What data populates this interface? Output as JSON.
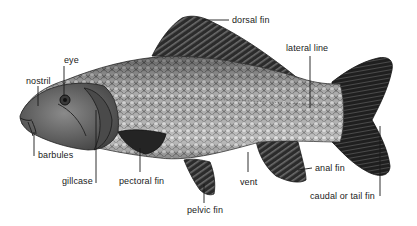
{
  "diagram": {
    "labels": [
      {
        "id": "dorsal-fin",
        "text": "dorsal fin",
        "x": 232,
        "y": 16
      },
      {
        "id": "eye",
        "text": "eye",
        "x": 64,
        "y": 56
      },
      {
        "id": "lateral-line",
        "text": "lateral line",
        "x": 286,
        "y": 43
      },
      {
        "id": "nostril",
        "text": "nostril",
        "x": 26,
        "y": 76
      },
      {
        "id": "barbules",
        "text": "barbules",
        "x": 38,
        "y": 150
      },
      {
        "id": "gillcase",
        "text": "gillcase",
        "x": 62,
        "y": 175
      },
      {
        "id": "pectoral-fin",
        "text": "pectoral fin",
        "x": 119,
        "y": 175
      },
      {
        "id": "anal-fin",
        "text": "anal fin",
        "x": 315,
        "y": 163
      },
      {
        "id": "vent",
        "text": "vent",
        "x": 240,
        "y": 177
      },
      {
        "id": "caudal-fin",
        "text": "caudal or tail fin",
        "x": 310,
        "y": 191
      },
      {
        "id": "pelvic-fin",
        "text": "pelvic fin",
        "x": 187,
        "y": 205
      }
    ],
    "colors": {
      "body": "#a9a9a9",
      "fin": "#2e2e2e",
      "head": "#5a5a5a",
      "line": "#1a1a1a",
      "text": "#1a1a1a"
    }
  }
}
